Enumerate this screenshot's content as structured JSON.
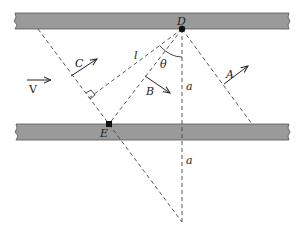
{
  "diagram": {
    "points": {
      "D": {
        "label": "D"
      },
      "E": {
        "label": "E"
      }
    },
    "vectors": {
      "V": {
        "label": "V"
      },
      "A": {
        "label": "A"
      },
      "B": {
        "label": "B"
      },
      "C": {
        "label": "C"
      }
    },
    "length_label": "l",
    "angle_label": "θ",
    "distance_labels": [
      "a",
      "a"
    ],
    "colors": {
      "plate": "#9a9a9a",
      "ink": "#222222"
    }
  }
}
